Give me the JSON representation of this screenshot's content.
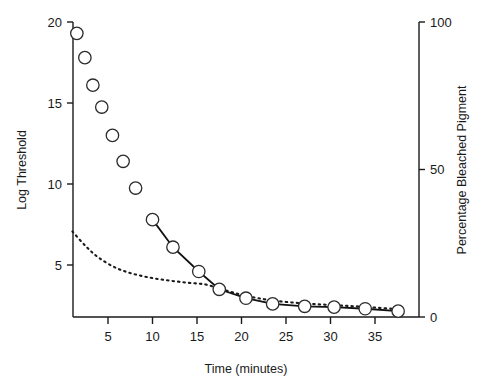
{
  "chart_data": {
    "type": "scatter",
    "title": "",
    "xlabel": "Time (minutes)",
    "ylabel": "Log Threshold",
    "ylabel_right": "Percentage Bleached Pigment",
    "xlim": [
      0,
      39.5
    ],
    "ylim": [
      1.5,
      20.5
    ],
    "ylim_right": [
      0,
      100
    ],
    "xticks": [
      5,
      10,
      15,
      20,
      25,
      30,
      35
    ],
    "yticks": [
      5,
      10,
      15,
      20
    ],
    "yticks_right": [
      0,
      50,
      100
    ],
    "grid": false,
    "legend": "none",
    "series": [
      {
        "name": "Log threshold (early recovery, unconnected points)",
        "axis": "left",
        "marker": "open-circle",
        "connected": false,
        "points": [
          {
            "x": 1.5,
            "y": 19.3
          },
          {
            "x": 2.4,
            "y": 17.8
          },
          {
            "x": 3.3,
            "y": 16.1
          },
          {
            "x": 4.3,
            "y": 14.75
          },
          {
            "x": 5.5,
            "y": 13.0
          },
          {
            "x": 6.7,
            "y": 11.4
          },
          {
            "x": 8.1,
            "y": 9.75
          }
        ]
      },
      {
        "name": "Log threshold (late recovery, connected by line)",
        "axis": "left",
        "marker": "open-circle",
        "connected": true,
        "points": [
          {
            "x": 10.0,
            "y": 7.8
          },
          {
            "x": 12.3,
            "y": 6.1
          },
          {
            "x": 15.2,
            "y": 4.6
          },
          {
            "x": 17.5,
            "y": 3.5
          },
          {
            "x": 20.5,
            "y": 2.95
          },
          {
            "x": 23.5,
            "y": 2.6
          },
          {
            "x": 27.1,
            "y": 2.45
          },
          {
            "x": 30.4,
            "y": 2.4
          },
          {
            "x": 33.9,
            "y": 2.3
          },
          {
            "x": 37.6,
            "y": 2.15
          }
        ]
      },
      {
        "name": "Percentage bleached pigment (dotted curve)",
        "axis": "right",
        "marker": "none",
        "connected": true,
        "style": "dotted",
        "points": [
          {
            "x": 1.0,
            "y": 29
          },
          {
            "x": 2.5,
            "y": 24
          },
          {
            "x": 4.0,
            "y": 20
          },
          {
            "x": 6.0,
            "y": 16.5
          },
          {
            "x": 8.0,
            "y": 14.5
          },
          {
            "x": 10.0,
            "y": 13.2
          },
          {
            "x": 12.0,
            "y": 12.3
          },
          {
            "x": 14.0,
            "y": 11.6
          },
          {
            "x": 16.0,
            "y": 11.0
          },
          {
            "x": 18.0,
            "y": 9.2
          },
          {
            "x": 20.5,
            "y": 7.2
          },
          {
            "x": 23.5,
            "y": 5.6
          },
          {
            "x": 27.0,
            "y": 4.6
          },
          {
            "x": 30.5,
            "y": 4.0
          },
          {
            "x": 34.0,
            "y": 3.4
          },
          {
            "x": 37.8,
            "y": 2.6
          }
        ]
      }
    ]
  },
  "axes": {
    "left_title": "Log Threshold",
    "right_title": "Percentage Bleached Pigment",
    "bottom_title": "Time (minutes)",
    "left_tick_labels": [
      "20",
      "15",
      "10",
      "5"
    ],
    "right_tick_labels": [
      "100",
      "50",
      "0"
    ],
    "bottom_tick_labels": [
      "5",
      "10",
      "15",
      "20",
      "25",
      "30",
      "35"
    ]
  },
  "colors": {
    "ink": "#1a1a1a",
    "marker_fill": "#ffffff",
    "marker_stroke": "#2b2b2b",
    "background": "#ffffff"
  }
}
